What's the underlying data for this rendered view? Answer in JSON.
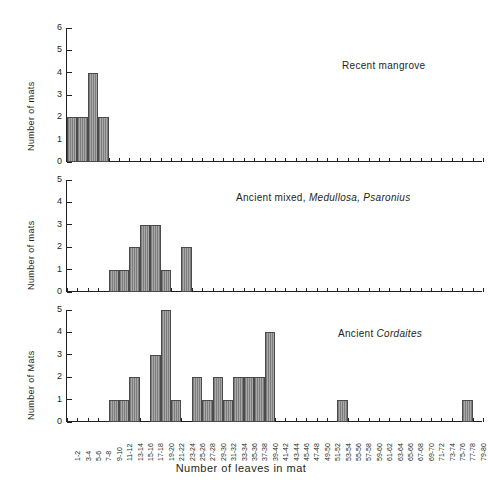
{
  "figure": {
    "xlabel": "Number of leaves in mat",
    "background": "#ffffff",
    "bar_fill": "#a8a8a8",
    "bar_edge": "#4a4a4a"
  },
  "bins": [
    "1-2",
    "3-4",
    "5-6",
    "7-8",
    "9-10",
    "11-12",
    "13-14",
    "15-16",
    "17-18",
    "19-20",
    "21-22",
    "23-24",
    "25-26",
    "27-28",
    "29-30",
    "31-32",
    "33-34",
    "35-36",
    "37-38",
    "39-40",
    "41-42",
    "43-44",
    "45-46",
    "47-48",
    "49-50",
    "51-52",
    "53-54",
    "55-56",
    "57-58",
    "59-60",
    "61-62",
    "63-64",
    "65-66",
    "67-68",
    "69-70",
    "71-72",
    "73-74",
    "75-76",
    "77-78",
    "79-80"
  ],
  "panels": [
    {
      "id": "recent-mangrove",
      "annotation": "Recent mangrove",
      "annotation_italic": "",
      "ylabel": "Number of mats",
      "yticks": [
        "0",
        "1",
        "2",
        "3",
        "4",
        "5",
        "6"
      ],
      "ymax": 6
    },
    {
      "id": "ancient-mixed",
      "annotation": "Ancient mixed,",
      "annotation_italic": "Medullosa, Psaronius",
      "ylabel": "Number of mats",
      "yticks": [
        "0",
        "1",
        "2",
        "3",
        "4",
        "5"
      ],
      "ymax": 5
    },
    {
      "id": "ancient-cordaites",
      "annotation": "Ancient",
      "annotation_italic": "Cordaites",
      "ylabel": "Number of Mats",
      "yticks": [
        "0",
        "1",
        "2",
        "3",
        "4",
        "5"
      ],
      "ymax": 5
    }
  ],
  "chart_data": [
    {
      "type": "bar",
      "title": "Recent mangrove",
      "xlabel": "Number of leaves in mat",
      "ylabel": "Number of mats",
      "ylim": [
        0,
        6
      ],
      "grid": false,
      "categories": [
        "1-2",
        "3-4",
        "5-6",
        "7-8",
        "9-10",
        "11-12",
        "13-14",
        "15-16",
        "17-18",
        "19-20",
        "21-22",
        "23-24",
        "25-26",
        "27-28",
        "29-30",
        "31-32",
        "33-34",
        "35-36",
        "37-38",
        "39-40",
        "41-42",
        "43-44",
        "45-46",
        "47-48",
        "49-50",
        "51-52",
        "53-54",
        "55-56",
        "57-58",
        "59-60",
        "61-62",
        "63-64",
        "65-66",
        "67-68",
        "69-70",
        "71-72",
        "73-74",
        "75-76",
        "77-78",
        "79-80"
      ],
      "values": [
        2,
        2,
        4,
        2,
        0,
        0,
        0,
        0,
        0,
        0,
        0,
        0,
        0,
        0,
        0,
        0,
        0,
        0,
        0,
        0,
        0,
        0,
        0,
        0,
        0,
        0,
        0,
        0,
        0,
        0,
        0,
        0,
        0,
        0,
        0,
        0,
        0,
        0,
        0,
        0
      ]
    },
    {
      "type": "bar",
      "title": "Ancient mixed, Medullosa, Psaronius",
      "xlabel": "Number of leaves in mat",
      "ylabel": "Number of mats",
      "ylim": [
        0,
        5
      ],
      "grid": false,
      "categories": [
        "1-2",
        "3-4",
        "5-6",
        "7-8",
        "9-10",
        "11-12",
        "13-14",
        "15-16",
        "17-18",
        "19-20",
        "21-22",
        "23-24",
        "25-26",
        "27-28",
        "29-30",
        "31-32",
        "33-34",
        "35-36",
        "37-38",
        "39-40",
        "41-42",
        "43-44",
        "45-46",
        "47-48",
        "49-50",
        "51-52",
        "53-54",
        "55-56",
        "57-58",
        "59-60",
        "61-62",
        "63-64",
        "65-66",
        "67-68",
        "69-70",
        "71-72",
        "73-74",
        "75-76",
        "77-78",
        "79-80"
      ],
      "values": [
        0,
        0,
        0,
        0,
        1,
        1,
        2,
        3,
        3,
        1,
        0,
        2,
        0,
        0,
        0,
        0,
        0,
        0,
        0,
        0,
        0,
        0,
        0,
        0,
        0,
        0,
        0,
        0,
        0,
        0,
        0,
        0,
        0,
        0,
        0,
        0,
        0,
        0,
        0,
        0
      ]
    },
    {
      "type": "bar",
      "title": "Ancient Cordaites",
      "xlabel": "Number of leaves in mat",
      "ylabel": "Number of Mats",
      "ylim": [
        0,
        5
      ],
      "grid": false,
      "categories": [
        "1-2",
        "3-4",
        "5-6",
        "7-8",
        "9-10",
        "11-12",
        "13-14",
        "15-16",
        "17-18",
        "19-20",
        "21-22",
        "23-24",
        "25-26",
        "27-28",
        "29-30",
        "31-32",
        "33-34",
        "35-36",
        "37-38",
        "39-40",
        "41-42",
        "43-44",
        "45-46",
        "47-48",
        "49-50",
        "51-52",
        "53-54",
        "55-56",
        "57-58",
        "59-60",
        "61-62",
        "63-64",
        "65-66",
        "67-68",
        "69-70",
        "71-72",
        "73-74",
        "75-76",
        "77-78",
        "79-80"
      ],
      "values": [
        0,
        0,
        0,
        0,
        1,
        1,
        2,
        0,
        3,
        5,
        1,
        0,
        2,
        1,
        2,
        1,
        2,
        2,
        2,
        4,
        0,
        0,
        0,
        0,
        0,
        0,
        1,
        0,
        0,
        0,
        0,
        0,
        0,
        0,
        0,
        0,
        0,
        0,
        1,
        0
      ]
    }
  ]
}
